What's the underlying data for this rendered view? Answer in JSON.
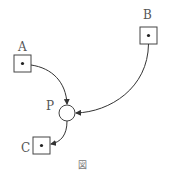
{
  "diagram": {
    "nodes": [
      {
        "id": "A",
        "label": "A",
        "shape": "square-with-dot"
      },
      {
        "id": "B",
        "label": "B",
        "shape": "square-with-dot"
      },
      {
        "id": "P",
        "label": "P",
        "shape": "circle"
      },
      {
        "id": "C",
        "label": "C",
        "shape": "square-with-dot"
      }
    ],
    "edges": [
      {
        "from": "A",
        "to": "P"
      },
      {
        "from": "B",
        "to": "P"
      },
      {
        "from": "P",
        "to": "C"
      }
    ],
    "caption": "図"
  }
}
